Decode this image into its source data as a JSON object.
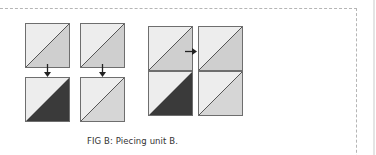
{
  "figure": {
    "caption": "FIG B: Piecing unit B.",
    "colors": {
      "light": "#ededed",
      "medium": "#cfcfcf",
      "dark": "#3a3a3a",
      "outline": "#6e6e6e",
      "frame": "#b5b5b5"
    },
    "steps": [
      {
        "top": "light/medium half-square triangle",
        "bottom": "light/dark half-square triangle"
      },
      {
        "top": "light/medium half-square triangle",
        "bottom": "light/medium half-square triangle"
      }
    ],
    "result": {
      "left_column": [
        "light/medium",
        "light/dark"
      ],
      "right_column": [
        "light/medium",
        "light/medium"
      ]
    }
  }
}
